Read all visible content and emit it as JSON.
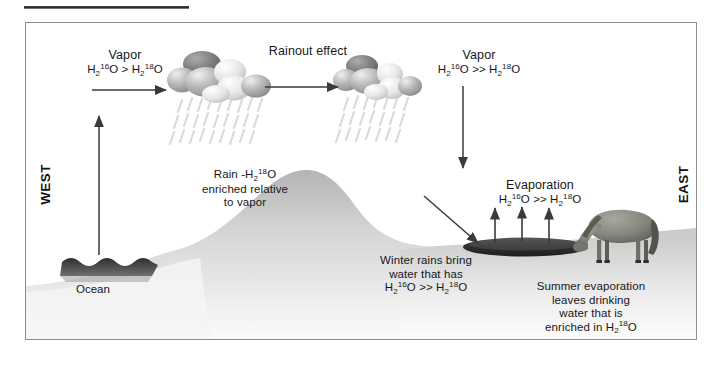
{
  "figure": {
    "title_rule": "",
    "compass": {
      "west": "WEST",
      "east": "EAST"
    },
    "labels": {
      "vapor_west_title": "Vapor",
      "vapor_west_formula_h": "H",
      "rainout_effect": "Rainout effect",
      "vapor_east_title": "Vapor",
      "evaporation_title": "Evaporation",
      "ocean": "Ocean",
      "rain_line1": "Rain -",
      "rain_line2": "enriched relative",
      "rain_line3": "to vapor",
      "winter_line1": "Winter rains bring",
      "winter_line2": "water that has",
      "summer_line1": "Summer evaporation",
      "summer_line2": "leaves drinking",
      "summer_line3": "water that is",
      "summer_line4": "enriched in"
    },
    "formulas": {
      "single_gt": {
        "left_h": "H",
        "left_sub": "2",
        "left_sup": "16",
        "left_o": "O",
        "op": ">",
        "right_h": "H",
        "right_sub": "2",
        "right_sup": "18",
        "right_o": "O"
      },
      "double_gt": {
        "left_h": "H",
        "left_sub": "2",
        "left_sup": "16",
        "left_o": "O",
        "op": ">>",
        "right_h": "H",
        "right_sub": "2",
        "right_sup": "18",
        "right_o": "O"
      },
      "h2_18o": {
        "h": "H",
        "sub": "2",
        "sup": "18",
        "o": "O"
      }
    },
    "colors": {
      "text": "#17171a",
      "frame_border": "#8d8d8d",
      "arrow": "#3a3a3a",
      "cloud_dark": "#7d7d7d",
      "cloud_mid": "#a8a8a8",
      "cloud_light": "#e2e2e2",
      "terrain": "#cfcfcf",
      "ocean": "#3c3c3c",
      "lake": "#404040",
      "horse": "#8a8a82",
      "background": "#ffffff"
    },
    "elements": {
      "cloud_west": "cloud-with-rain",
      "cloud_east": "cloud-with-rain",
      "arrow_ocean_to_cloud": "up-arrow",
      "arrow_cloud_to_cloud": "right-arrow",
      "arrow_vapor_descend": "down-arrow",
      "arrow_mountain_lee": "diagonal-down-right-arrow",
      "evaporation_arrows": "three-up-arrows",
      "animal": "horse"
    }
  }
}
